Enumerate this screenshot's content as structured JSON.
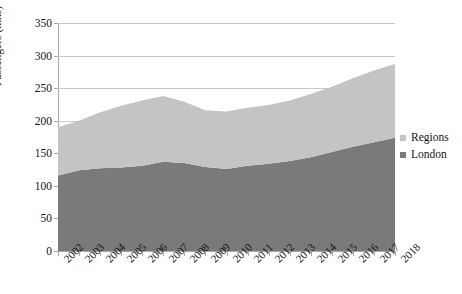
{
  "chart_data": {
    "type": "area",
    "stacked": true,
    "title": "",
    "xlabel": "",
    "ylabel": "Passengers (mns)",
    "ylim": [
      0,
      350
    ],
    "ytick_values": [
      0,
      50,
      100,
      150,
      200,
      250,
      300,
      350
    ],
    "ytick_labels": [
      "0",
      "50",
      "100",
      "150",
      "200",
      "250",
      "300",
      "350"
    ],
    "grid": true,
    "grid_axis": "y",
    "legend_position": "right",
    "categories": [
      "2002",
      "2003",
      "2004",
      "2005",
      "2006",
      "2007",
      "2008",
      "2009",
      "2010",
      "2011",
      "2012",
      "2013",
      "2014",
      "2015",
      "2016",
      "2017",
      "2018"
    ],
    "x": [
      "2002",
      "2003",
      "2004",
      "2005",
      "2006",
      "2007",
      "2008",
      "2009",
      "2010",
      "2011",
      "2012",
      "2013",
      "2014",
      "2015",
      "2016",
      "2017",
      "2018"
    ],
    "series": [
      {
        "name": "London",
        "color": "#7a7a7a",
        "values": [
          116,
          124,
          127,
          128,
          131,
          137,
          135,
          129,
          126,
          131,
          134,
          138,
          144,
          152,
          160,
          167,
          174
        ]
      },
      {
        "name": "Regions",
        "color": "#c4c4c4",
        "values": [
          74,
          76,
          86,
          95,
          100,
          101,
          94,
          87,
          88,
          89,
          90,
          93,
          97,
          100,
          105,
          110,
          113
        ]
      }
    ],
    "totals": [
      190,
      200,
      213,
      223,
      231,
      238,
      229,
      216,
      214,
      220,
      224,
      231,
      241,
      252,
      265,
      277,
      287
    ]
  },
  "legend": {
    "items": [
      {
        "label": "Regions",
        "color": "#c4c4c4"
      },
      {
        "label": "London",
        "color": "#7a7a7a"
      }
    ]
  },
  "axes": {
    "y_title": "Passengers (mns)"
  }
}
